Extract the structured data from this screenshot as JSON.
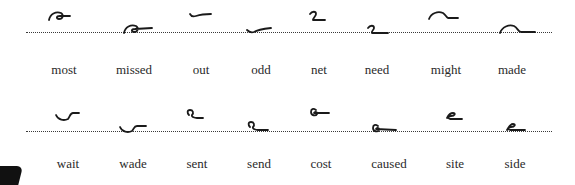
{
  "figure": {
    "rows": [
      {
        "pairs": [
          {
            "word": "most",
            "position": "above-line"
          },
          {
            "word": "missed",
            "position": "on-line"
          },
          {
            "word": "out",
            "position": "above-line"
          },
          {
            "word": "odd",
            "position": "on-line"
          },
          {
            "word": "net",
            "position": "above-line"
          },
          {
            "word": "need",
            "position": "on-line"
          },
          {
            "word": "might",
            "position": "above-line"
          },
          {
            "word": "made",
            "position": "on-line"
          }
        ]
      },
      {
        "pairs": [
          {
            "word": "wait",
            "position": "above-line"
          },
          {
            "word": "wade",
            "position": "on-line"
          },
          {
            "word": "sent",
            "position": "above-line"
          },
          {
            "word": "send",
            "position": "on-line"
          },
          {
            "word": "cost",
            "position": "above-line"
          },
          {
            "word": "caused",
            "position": "on-line"
          },
          {
            "word": "site",
            "position": "above-line"
          },
          {
            "word": "side",
            "position": "on-line"
          }
        ]
      }
    ],
    "colors": {
      "ink": "#1a1a1a",
      "text": "#2a2a2a",
      "dotted_line": "#3a3a3a",
      "background": "#ffffff"
    }
  }
}
